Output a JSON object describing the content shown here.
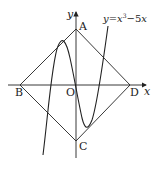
{
  "diagram": {
    "function_label": {
      "prefix": "y",
      "eq": "=",
      "x": "x",
      "exp": "3",
      "rest": "−5",
      "x2": "x"
    },
    "axes": {
      "x_label": "x",
      "y_label": "y",
      "origin_label": "O"
    },
    "points": {
      "A": {
        "label": "A"
      },
      "B": {
        "label": "B"
      },
      "C": {
        "label": "C"
      },
      "D": {
        "label": "D"
      }
    },
    "colors": {
      "stroke": "#222222",
      "background": "#ffffff"
    }
  }
}
